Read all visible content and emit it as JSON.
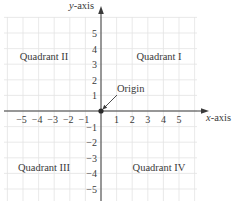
{
  "diagram": {
    "type": "cartesian-coordinate-plane",
    "axes": {
      "x_label_var": "x",
      "x_label_suffix": "-axis",
      "y_label_var": "y",
      "y_label_suffix": "-axis"
    },
    "x_ticks": [
      {
        "value": -5,
        "label": "−5"
      },
      {
        "value": -4,
        "label": "−4"
      },
      {
        "value": -3,
        "label": "−3"
      },
      {
        "value": -2,
        "label": "−2"
      },
      {
        "value": -1,
        "label": "−1"
      },
      {
        "value": 1,
        "label": "1"
      },
      {
        "value": 2,
        "label": "2"
      },
      {
        "value": 3,
        "label": "3"
      },
      {
        "value": 4,
        "label": "4"
      },
      {
        "value": 5,
        "label": "5"
      }
    ],
    "y_ticks": [
      {
        "value": 5,
        "label": "5"
      },
      {
        "value": 4,
        "label": "4"
      },
      {
        "value": 3,
        "label": "3"
      },
      {
        "value": 2,
        "label": "2"
      },
      {
        "value": 1,
        "label": "1"
      },
      {
        "value": -1,
        "label": "−1"
      },
      {
        "value": -2,
        "label": "−2"
      },
      {
        "value": -3,
        "label": "−3"
      },
      {
        "value": -4,
        "label": "−4"
      },
      {
        "value": -5,
        "label": "−5"
      }
    ],
    "quadrants": {
      "q1": "Quadrant I",
      "q2": "Quadrant II",
      "q3": "Quadrant III",
      "q4": "Quadrant IV"
    },
    "origin": {
      "label": "Origin",
      "point": [
        0,
        0
      ]
    },
    "colors": {
      "grid": "#e3e3e3",
      "axis": "#3a3a3a",
      "text": "#3a3a3a",
      "background": "#ffffff"
    }
  }
}
